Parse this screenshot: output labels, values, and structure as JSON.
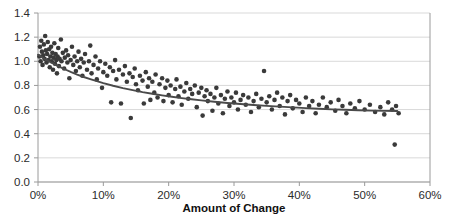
{
  "chart_data": {
    "type": "scatter",
    "title": "",
    "subtitle": "",
    "xlabel": "Amount of Change",
    "ylabel": "",
    "xlim": [
      0,
      0.6
    ],
    "ylim": [
      0.0,
      1.4
    ],
    "grid": true,
    "grid_axis": "y",
    "legend": "none",
    "x_tick_labels": [
      "0%",
      "10%",
      "20%",
      "30%",
      "40%",
      "50%",
      "60%"
    ],
    "x_tick_values": [
      0,
      0.1,
      0.2,
      0.3,
      0.4,
      0.5,
      0.6
    ],
    "y_tick_labels": [
      "0.0",
      "0.2",
      "0.4",
      "0.6",
      "0.8",
      "1.0",
      "1.2",
      "1.4"
    ],
    "y_tick_values": [
      0.0,
      0.2,
      0.4,
      0.6,
      0.8,
      1.0,
      1.2,
      1.4
    ],
    "marker_color": "#3a3a3a",
    "trendline_color": "#4a4a4a",
    "gridline_color": "#d9d9d9",
    "axis_color": "#9a9a9a",
    "series": [
      {
        "name": "observations",
        "marker": "circle",
        "points": [
          [
            0.002,
            1.04
          ],
          [
            0.003,
            1.12
          ],
          [
            0.004,
            1.0
          ],
          [
            0.005,
            1.17
          ],
          [
            0.006,
            1.08
          ],
          [
            0.007,
            0.97
          ],
          [
            0.008,
            1.05
          ],
          [
            0.009,
            1.14
          ],
          [
            0.01,
            1.02
          ],
          [
            0.011,
            1.21
          ],
          [
            0.012,
            1.09
          ],
          [
            0.013,
            0.99
          ],
          [
            0.014,
            1.06
          ],
          [
            0.015,
            1.16
          ],
          [
            0.016,
            1.01
          ],
          [
            0.017,
            1.1
          ],
          [
            0.018,
            0.95
          ],
          [
            0.019,
            1.04
          ],
          [
            0.02,
            1.12
          ],
          [
            0.021,
            1.0
          ],
          [
            0.022,
            1.07
          ],
          [
            0.023,
            0.93
          ],
          [
            0.024,
            1.03
          ],
          [
            0.025,
            1.15
          ],
          [
            0.026,
            0.98
          ],
          [
            0.027,
            1.06
          ],
          [
            0.028,
            1.01
          ],
          [
            0.029,
            0.9
          ],
          [
            0.03,
            1.04
          ],
          [
            0.031,
            1.11
          ],
          [
            0.032,
            0.96
          ],
          [
            0.033,
            1.02
          ],
          [
            0.035,
            1.18
          ],
          [
            0.036,
            1.0
          ],
          [
            0.038,
            1.07
          ],
          [
            0.04,
            0.94
          ],
          [
            0.041,
            1.03
          ],
          [
            0.043,
            1.09
          ],
          [
            0.045,
            0.99
          ],
          [
            0.046,
            1.05
          ],
          [
            0.048,
            0.86
          ],
          [
            0.05,
            1.01
          ],
          [
            0.052,
            1.12
          ],
          [
            0.054,
            0.97
          ],
          [
            0.056,
            1.04
          ],
          [
            0.058,
            0.92
          ],
          [
            0.06,
            1.0
          ],
          [
            0.062,
            1.08
          ],
          [
            0.064,
            0.95
          ],
          [
            0.066,
            1.02
          ],
          [
            0.068,
            0.88
          ],
          [
            0.07,
            0.99
          ],
          [
            0.072,
            1.06
          ],
          [
            0.075,
            0.93
          ],
          [
            0.078,
            1.0
          ],
          [
            0.08,
            1.13
          ],
          [
            0.082,
            0.9
          ],
          [
            0.085,
            0.97
          ],
          [
            0.088,
            1.04
          ],
          [
            0.09,
            0.85
          ],
          [
            0.092,
            0.94
          ],
          [
            0.095,
            1.0
          ],
          [
            0.098,
            0.78
          ],
          [
            0.1,
            0.91
          ],
          [
            0.103,
            0.98
          ],
          [
            0.106,
            0.88
          ],
          [
            0.11,
            0.95
          ],
          [
            0.112,
            0.66
          ],
          [
            0.115,
            0.92
          ],
          [
            0.118,
            1.01
          ],
          [
            0.12,
            0.85
          ],
          [
            0.124,
            0.93
          ],
          [
            0.127,
            0.65
          ],
          [
            0.13,
            0.89
          ],
          [
            0.133,
            0.96
          ],
          [
            0.136,
            0.83
          ],
          [
            0.14,
            0.9
          ],
          [
            0.142,
            0.53
          ],
          [
            0.145,
            0.87
          ],
          [
            0.148,
            0.94
          ],
          [
            0.15,
            0.81
          ],
          [
            0.153,
            0.76
          ],
          [
            0.156,
            0.88
          ],
          [
            0.16,
            0.84
          ],
          [
            0.162,
            0.65
          ],
          [
            0.165,
            0.91
          ],
          [
            0.168,
            0.79
          ],
          [
            0.17,
            0.86
          ],
          [
            0.172,
            0.68
          ],
          [
            0.175,
            0.83
          ],
          [
            0.178,
            0.74
          ],
          [
            0.18,
            0.89
          ],
          [
            0.183,
            0.7
          ],
          [
            0.186,
            0.81
          ],
          [
            0.19,
            0.86
          ],
          [
            0.192,
            0.67
          ],
          [
            0.195,
            0.78
          ],
          [
            0.198,
            0.84
          ],
          [
            0.2,
            0.72
          ],
          [
            0.203,
            0.8
          ],
          [
            0.206,
            0.66
          ],
          [
            0.21,
            0.77
          ],
          [
            0.212,
            0.85
          ],
          [
            0.215,
            0.71
          ],
          [
            0.218,
            0.79
          ],
          [
            0.22,
            0.64
          ],
          [
            0.224,
            0.75
          ],
          [
            0.227,
            0.82
          ],
          [
            0.23,
            0.69
          ],
          [
            0.233,
            0.77
          ],
          [
            0.236,
            0.73
          ],
          [
            0.24,
            0.8
          ],
          [
            0.243,
            0.62
          ],
          [
            0.246,
            0.74
          ],
          [
            0.25,
            0.78
          ],
          [
            0.252,
            0.55
          ],
          [
            0.255,
            0.71
          ],
          [
            0.258,
            0.76
          ],
          [
            0.26,
            0.67
          ],
          [
            0.264,
            0.73
          ],
          [
            0.267,
            0.59
          ],
          [
            0.27,
            0.7
          ],
          [
            0.273,
            0.78
          ],
          [
            0.276,
            0.65
          ],
          [
            0.28,
            0.72
          ],
          [
            0.283,
            0.57
          ],
          [
            0.286,
            0.69
          ],
          [
            0.29,
            0.75
          ],
          [
            0.293,
            0.63
          ],
          [
            0.296,
            0.7
          ],
          [
            0.3,
            0.66
          ],
          [
            0.303,
            0.74
          ],
          [
            0.306,
            0.6
          ],
          [
            0.31,
            0.68
          ],
          [
            0.314,
            0.72
          ],
          [
            0.318,
            0.64
          ],
          [
            0.322,
            0.7
          ],
          [
            0.326,
            0.58
          ],
          [
            0.33,
            0.67
          ],
          [
            0.334,
            0.73
          ],
          [
            0.338,
            0.62
          ],
          [
            0.342,
            0.69
          ],
          [
            0.346,
            0.92
          ],
          [
            0.35,
            0.66
          ],
          [
            0.354,
            0.71
          ],
          [
            0.358,
            0.6
          ],
          [
            0.362,
            0.68
          ],
          [
            0.366,
            0.74
          ],
          [
            0.37,
            0.63
          ],
          [
            0.374,
            0.7
          ],
          [
            0.378,
            0.56
          ],
          [
            0.382,
            0.67
          ],
          [
            0.386,
            0.72
          ],
          [
            0.39,
            0.61
          ],
          [
            0.395,
            0.68
          ],
          [
            0.4,
            0.65
          ],
          [
            0.405,
            0.58
          ],
          [
            0.41,
            0.7
          ],
          [
            0.415,
            0.63
          ],
          [
            0.42,
            0.67
          ],
          [
            0.425,
            0.57
          ],
          [
            0.43,
            0.64
          ],
          [
            0.436,
            0.7
          ],
          [
            0.442,
            0.62
          ],
          [
            0.448,
            0.66
          ],
          [
            0.455,
            0.59
          ],
          [
            0.46,
            0.68
          ],
          [
            0.466,
            0.63
          ],
          [
            0.472,
            0.57
          ],
          [
            0.478,
            0.65
          ],
          [
            0.485,
            0.61
          ],
          [
            0.492,
            0.67
          ],
          [
            0.5,
            0.6
          ],
          [
            0.508,
            0.64
          ],
          [
            0.516,
            0.58
          ],
          [
            0.524,
            0.62
          ],
          [
            0.53,
            0.56
          ],
          [
            0.536,
            0.66
          ],
          [
            0.542,
            0.6
          ],
          [
            0.548,
            0.63
          ],
          [
            0.552,
            0.57
          ],
          [
            0.546,
            0.31
          ]
        ]
      }
    ],
    "trendline": {
      "name": "fitted-trend",
      "points": [
        [
          0.0,
          1.055
        ],
        [
          0.01,
          1.02
        ],
        [
          0.02,
          0.99
        ],
        [
          0.03,
          0.962
        ],
        [
          0.04,
          0.936
        ],
        [
          0.05,
          0.912
        ],
        [
          0.06,
          0.89
        ],
        [
          0.07,
          0.87
        ],
        [
          0.08,
          0.852
        ],
        [
          0.09,
          0.835
        ],
        [
          0.1,
          0.819
        ],
        [
          0.115,
          0.797
        ],
        [
          0.13,
          0.778
        ],
        [
          0.145,
          0.761
        ],
        [
          0.16,
          0.745
        ],
        [
          0.175,
          0.731
        ],
        [
          0.19,
          0.718
        ],
        [
          0.205,
          0.706
        ],
        [
          0.22,
          0.695
        ],
        [
          0.235,
          0.685
        ],
        [
          0.25,
          0.676
        ],
        [
          0.27,
          0.665
        ],
        [
          0.29,
          0.655
        ],
        [
          0.31,
          0.646
        ],
        [
          0.33,
          0.638
        ],
        [
          0.35,
          0.631
        ],
        [
          0.37,
          0.624
        ],
        [
          0.39,
          0.618
        ],
        [
          0.41,
          0.612
        ],
        [
          0.43,
          0.607
        ],
        [
          0.45,
          0.602
        ],
        [
          0.47,
          0.598
        ],
        [
          0.49,
          0.594
        ],
        [
          0.51,
          0.591
        ],
        [
          0.53,
          0.589
        ],
        [
          0.55,
          0.588
        ]
      ]
    }
  }
}
